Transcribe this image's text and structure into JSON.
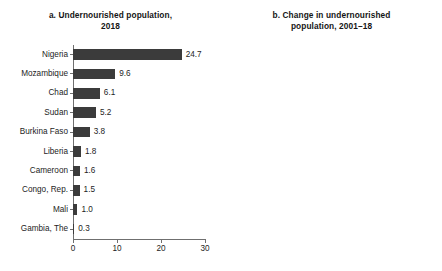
{
  "figure": {
    "background_color": "#ffffff",
    "bar_color": "#3b3b3b",
    "axis_color": "#6f6f6f"
  },
  "panel_a": {
    "title_line1": "a. Undernourished population,",
    "title_line2": "2018"
  },
  "panel_b": {
    "title_line1": "b. Change in undernourished",
    "title_line2": "population, 2001–18"
  },
  "chart_data": [
    {
      "type": "bar",
      "orientation": "horizontal",
      "title": "a. Undernourished population, 2018",
      "xlabel": "",
      "ylabel": "",
      "xlim": [
        0,
        30
      ],
      "xticks": [
        0,
        10,
        20,
        30
      ],
      "xtick_labels": [
        "0",
        "10",
        "20",
        "30"
      ],
      "grid": false,
      "legend": "none",
      "categories": [
        "Nigeria",
        "Mozambique",
        "Chad",
        "Sudan",
        "Burkina Faso",
        "Liberia",
        "Cameroon",
        "Congo, Rep.",
        "Mali",
        "Gambia, The"
      ],
      "values": [
        24.7,
        9.6,
        6.1,
        5.2,
        3.8,
        1.8,
        1.6,
        1.5,
        1.0,
        0.3
      ],
      "value_labels": [
        "24.7",
        "9.6",
        "6.1",
        "5.2",
        "3.8",
        "1.8",
        "1.6",
        "1.5",
        "1.0",
        "0.3"
      ]
    },
    {
      "type": "bar",
      "orientation": "horizontal",
      "title": "b. Change in undernourished population, 2001–18",
      "xlabel": "",
      "ylabel": "",
      "xlim": [
        -5,
        15
      ],
      "xticks": [
        -5,
        0,
        5,
        10,
        15
      ],
      "xtick_labels": [
        "–5",
        "0",
        "5",
        "10",
        "15"
      ],
      "grid": false,
      "zero_reference_line": 0,
      "legend": "none",
      "categories": [
        "Nigeria",
        "Mozambique",
        "Chad",
        "Burkina Faso",
        "Liberia",
        "Congo, Rep.",
        "Gambia, The",
        "Mali",
        "Sudan",
        "Cameroon"
      ],
      "values": [
        13.3,
        2.9,
        2.7,
        0.9,
        0.7,
        0.6,
        0.0,
        -0.9,
        -0.9,
        -2.1
      ],
      "value_labels": [
        "13.3",
        "2.9",
        "2.7",
        "0.9",
        "0.7",
        "0.6",
        "0.0",
        "–0.9",
        "–0.9",
        "–2.1"
      ]
    }
  ]
}
